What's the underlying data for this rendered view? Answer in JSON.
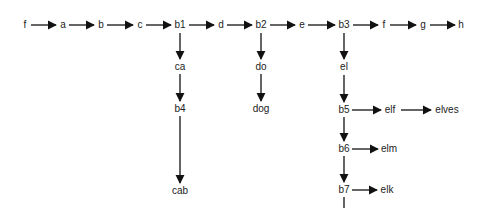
{
  "diagram": {
    "type": "trie-like directed graph",
    "colors": {
      "line": "#111111",
      "text": "#222222",
      "background": "#ffffff"
    },
    "nodes": [
      {
        "id": "n_f1",
        "label": "f",
        "x": 25,
        "y": 25
      },
      {
        "id": "n_a",
        "label": "a",
        "x": 63,
        "y": 25
      },
      {
        "id": "n_b",
        "label": "b",
        "x": 101,
        "y": 25
      },
      {
        "id": "n_c",
        "label": "c",
        "x": 140,
        "y": 25
      },
      {
        "id": "n_b1",
        "label": "b1",
        "x": 180,
        "y": 25
      },
      {
        "id": "n_d",
        "label": "d",
        "x": 221,
        "y": 25
      },
      {
        "id": "n_b2",
        "label": "b2",
        "x": 261,
        "y": 25
      },
      {
        "id": "n_e",
        "label": "e",
        "x": 302,
        "y": 25
      },
      {
        "id": "n_b3",
        "label": "b3",
        "x": 344,
        "y": 25
      },
      {
        "id": "n_f2",
        "label": "f",
        "x": 384,
        "y": 25
      },
      {
        "id": "n_g",
        "label": "g",
        "x": 423,
        "y": 25
      },
      {
        "id": "n_h",
        "label": "h",
        "x": 461,
        "y": 25
      },
      {
        "id": "n_ca",
        "label": "ca",
        "x": 180,
        "y": 67
      },
      {
        "id": "n_b4",
        "label": "b4",
        "x": 180,
        "y": 109
      },
      {
        "id": "n_cab",
        "label": "cab",
        "x": 180,
        "y": 191
      },
      {
        "id": "n_do",
        "label": "do",
        "x": 261,
        "y": 67
      },
      {
        "id": "n_dog",
        "label": "dog",
        "x": 261,
        "y": 109
      },
      {
        "id": "n_el",
        "label": "el",
        "x": 344,
        "y": 67
      },
      {
        "id": "n_b5",
        "label": "b5",
        "x": 344,
        "y": 110
      },
      {
        "id": "n_elf",
        "label": "elf",
        "x": 390,
        "y": 110
      },
      {
        "id": "n_elves",
        "label": "elves",
        "x": 447,
        "y": 110
      },
      {
        "id": "n_b6",
        "label": "b6",
        "x": 344,
        "y": 149
      },
      {
        "id": "n_elm",
        "label": "elm",
        "x": 389,
        "y": 149
      },
      {
        "id": "n_b7",
        "label": "b7",
        "x": 344,
        "y": 190
      },
      {
        "id": "n_elk",
        "label": "elk",
        "x": 387,
        "y": 190
      }
    ],
    "edges": [
      {
        "x1": 31,
        "y1": 25,
        "x2": 56,
        "y2": 25
      },
      {
        "x1": 69,
        "y1": 25,
        "x2": 94,
        "y2": 25
      },
      {
        "x1": 107,
        "y1": 25,
        "x2": 133,
        "y2": 25
      },
      {
        "x1": 146,
        "y1": 25,
        "x2": 171,
        "y2": 25
      },
      {
        "x1": 189,
        "y1": 25,
        "x2": 214,
        "y2": 25
      },
      {
        "x1": 227,
        "y1": 25,
        "x2": 252,
        "y2": 25
      },
      {
        "x1": 270,
        "y1": 25,
        "x2": 295,
        "y2": 25
      },
      {
        "x1": 308,
        "y1": 25,
        "x2": 335,
        "y2": 25
      },
      {
        "x1": 353,
        "y1": 25,
        "x2": 378,
        "y2": 25
      },
      {
        "x1": 390,
        "y1": 25,
        "x2": 416,
        "y2": 25
      },
      {
        "x1": 430,
        "y1": 25,
        "x2": 455,
        "y2": 25
      },
      {
        "x1": 180,
        "y1": 33,
        "x2": 180,
        "y2": 59
      },
      {
        "x1": 180,
        "y1": 74,
        "x2": 180,
        "y2": 101
      },
      {
        "x1": 180,
        "y1": 116,
        "x2": 180,
        "y2": 183
      },
      {
        "x1": 261,
        "y1": 33,
        "x2": 261,
        "y2": 59
      },
      {
        "x1": 261,
        "y1": 74,
        "x2": 261,
        "y2": 101
      },
      {
        "x1": 344,
        "y1": 33,
        "x2": 344,
        "y2": 59
      },
      {
        "x1": 344,
        "y1": 75,
        "x2": 344,
        "y2": 102
      },
      {
        "x1": 352,
        "y1": 110,
        "x2": 381,
        "y2": 110
      },
      {
        "x1": 401,
        "y1": 110,
        "x2": 431,
        "y2": 110
      },
      {
        "x1": 344,
        "y1": 117,
        "x2": 344,
        "y2": 141
      },
      {
        "x1": 352,
        "y1": 149,
        "x2": 378,
        "y2": 149
      },
      {
        "x1": 344,
        "y1": 156,
        "x2": 344,
        "y2": 182
      },
      {
        "x1": 352,
        "y1": 190,
        "x2": 377,
        "y2": 190
      },
      {
        "x1": 344,
        "y1": 197,
        "x2": 344,
        "y2": 208,
        "arrow": false
      }
    ]
  }
}
